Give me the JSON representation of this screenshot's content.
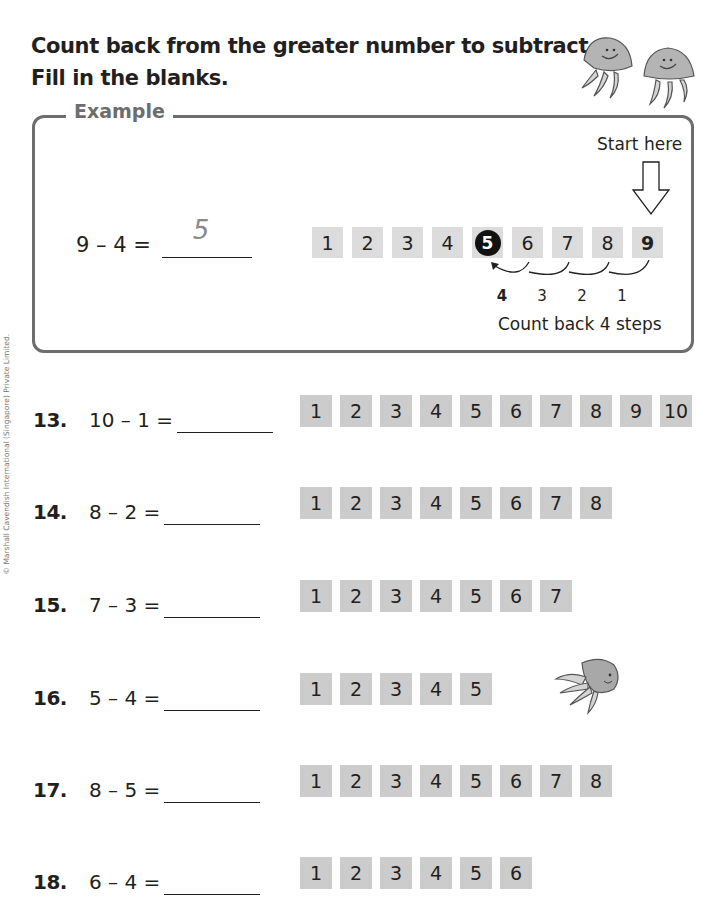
{
  "instructions": {
    "line1": "Count back from the greater number to subtract.",
    "line2": "Fill in the blanks."
  },
  "copyright": "© Marshall Cavendish International (Singapore) Private Limited.",
  "example": {
    "label": "Example",
    "equation": "9 – 4 =",
    "answer": "5",
    "start_label": "Start here",
    "number_line": [
      "1",
      "2",
      "3",
      "4",
      "5",
      "6",
      "7",
      "8",
      "9"
    ],
    "highlight_result": "5",
    "highlight_start": "9",
    "steps": [
      "4",
      "3",
      "2",
      "1"
    ],
    "caption": "Count back 4 steps"
  },
  "questions": [
    {
      "num": "13.",
      "equation": "10 – 1 =",
      "answer": "",
      "boxes": [
        "1",
        "2",
        "3",
        "4",
        "5",
        "6",
        "7",
        "8",
        "9",
        "10"
      ]
    },
    {
      "num": "14.",
      "equation": "8 – 2 =",
      "answer": "",
      "boxes": [
        "1",
        "2",
        "3",
        "4",
        "5",
        "6",
        "7",
        "8"
      ]
    },
    {
      "num": "15.",
      "equation": "7 – 3 =",
      "answer": "",
      "boxes": [
        "1",
        "2",
        "3",
        "4",
        "5",
        "6",
        "7"
      ]
    },
    {
      "num": "16.",
      "equation": "5 – 4 =",
      "answer": "",
      "boxes": [
        "1",
        "2",
        "3",
        "4",
        "5"
      ]
    },
    {
      "num": "17.",
      "equation": "8 – 5 =",
      "answer": "",
      "boxes": [
        "1",
        "2",
        "3",
        "4",
        "5",
        "6",
        "7",
        "8"
      ]
    },
    {
      "num": "18.",
      "equation": "6 – 4 =",
      "answer": "",
      "boxes": [
        "1",
        "2",
        "3",
        "4",
        "5",
        "6"
      ]
    }
  ],
  "illustrations": [
    "jellyfish-pair",
    "jellyfish-single"
  ],
  "colors": {
    "box_fill": "#cccccc",
    "example_box_fill": "#dcdcdc",
    "panel_border": "#6d6d6d",
    "text": "#231f20",
    "answer_handwriting": "#8a8a8a"
  }
}
